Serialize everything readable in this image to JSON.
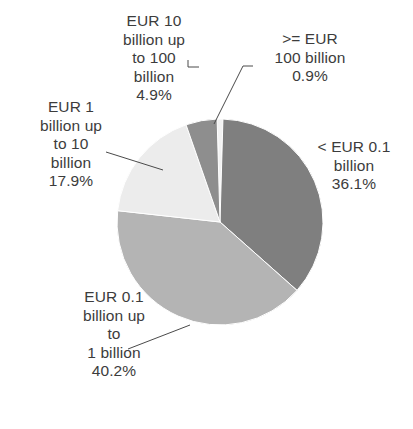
{
  "chart_data": {
    "type": "pie",
    "title": "",
    "xlabel": "",
    "ylabel": "",
    "unit": "percent",
    "legend_position": "none",
    "grid": false,
    "start_angle_deg": -1.6,
    "direction": "clockwise",
    "categories": [
      ">= EUR 100 billion",
      "< EUR 0.1 billion",
      "EUR 0.1 billion up to 1 billion",
      "EUR 1 billion up to 10 billion",
      "EUR 10 billion up to 100 billion"
    ],
    "values": [
      0.9,
      36.1,
      40.2,
      17.9,
      4.9
    ],
    "colors": [
      "#f2f2f2",
      "#7f7f7f",
      "#b4b4b4",
      "#ececec",
      "#8e8e8e"
    ],
    "slices": [
      {
        "name": ">= EUR 100 billion",
        "value": 0.9,
        "value_label": "0.9%",
        "color": "#f2f2f2",
        "label_lines": [
          ">= EUR",
          "100 billion",
          "0.9%"
        ]
      },
      {
        "name": "< EUR 0.1 billion",
        "value": 36.1,
        "value_label": "36.1%",
        "color": "#7f7f7f",
        "label_lines": [
          "< EUR 0.1",
          "billion",
          "36.1%"
        ]
      },
      {
        "name": "EUR 0.1 billion up to 1 billion",
        "value": 40.2,
        "value_label": "40.2%",
        "color": "#b4b4b4",
        "label_lines": [
          "EUR 0.1",
          "billion up",
          "to",
          "1 billion",
          "40.2%"
        ]
      },
      {
        "name": "EUR 1 billion up to 10 billion",
        "value": 17.9,
        "value_label": "17.9%",
        "color": "#ececec",
        "label_lines": [
          "EUR 1",
          "billion up",
          "to 10",
          "billion",
          "17.9%"
        ]
      },
      {
        "name": "EUR 10 billion up to 100 billion",
        "value": 4.9,
        "value_label": "4.9%",
        "color": "#8e8e8e",
        "label_lines": [
          "EUR 10",
          "billion up",
          "to 100",
          "billion",
          "4.9%"
        ]
      }
    ]
  },
  "labels": {
    "eur10_100": "EUR 10\nbillion up\nto 100\nbillion\n4.9%",
    "gte_100": ">= EUR\n100 billion\n0.9%",
    "lt_01": "< EUR 0.1\nbillion\n36.1%",
    "eur1_10": "EUR 1\nbillion up\nto 10\nbillion\n17.9%",
    "eur01_1": "EUR 0.1\nbillion up\nto\n1 billion\n40.2%"
  }
}
